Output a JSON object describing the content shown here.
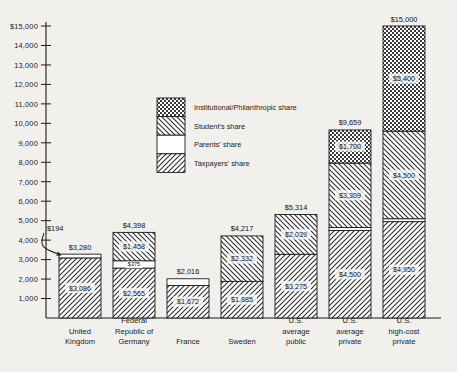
{
  "chart_data": {
    "type": "bar",
    "subtype": "stacked-bar",
    "title": "",
    "xlabel": "",
    "ylabel": "",
    "ylim": [
      0,
      15000
    ],
    "ytick_values": [
      1000,
      2000,
      3000,
      4000,
      5000,
      6000,
      7000,
      8000,
      9000,
      10000,
      11000,
      12000,
      13000,
      14000,
      15000
    ],
    "ytick_labels": [
      "1,000",
      "2,000",
      "3,000",
      "4,000",
      "5,000",
      "6,000",
      "7,000",
      "8,000",
      "9,000",
      "10,000",
      "11,000",
      "12,000",
      "13,000",
      "14,000",
      "$15,000"
    ],
    "grid": false,
    "legend_position": "upper-center",
    "categories": [
      "United Kingdom",
      "Federal Republic of Germany",
      "France",
      "Sweden",
      "U.S. average public",
      "U.S. average private",
      "U.S. high-cost private"
    ],
    "category_label_lines": [
      [
        "United",
        "Kingdom"
      ],
      [
        "Federal",
        "Republic of",
        "Germany"
      ],
      [
        "France"
      ],
      [
        "Sweden"
      ],
      [
        "U.S.",
        "average",
        "public"
      ],
      [
        "U.S.",
        "average",
        "private"
      ],
      [
        "U.S.",
        "high-cost",
        "private"
      ]
    ],
    "series": [
      {
        "name": "Taxpayers' share",
        "pattern": "diagonal-hatch-up",
        "values": [
          3086,
          2565,
          1672,
          1885,
          3275,
          4500,
          4950
        ],
        "labels": [
          "$3,086",
          "$2,565",
          "$1,672",
          "$1,885",
          "$3,275",
          "$4,500",
          "$4,950"
        ]
      },
      {
        "name": "Parents' share",
        "pattern": "solid-white",
        "values": [
          194,
          375,
          344,
          0,
          0,
          150,
          150
        ],
        "labels": [
          "$194",
          "$375",
          "$344",
          "",
          "",
          "$150",
          "$150"
        ]
      },
      {
        "name": "Student's share",
        "pattern": "diagonal-hatch-down",
        "values": [
          0,
          1458,
          0,
          2332,
          2039,
          3309,
          4500
        ],
        "labels": [
          "",
          "$1,458",
          "",
          "$2,332",
          "$2,039",
          "$3,309",
          "$4,500"
        ]
      },
      {
        "name": "Institutional/Philanthropic share",
        "pattern": "checkerboard",
        "values": [
          0,
          0,
          0,
          0,
          0,
          1700,
          5400
        ],
        "labels": [
          "",
          "",
          "",
          "",
          "",
          "$1,700",
          "$5,400"
        ]
      }
    ],
    "totals": [
      3280,
      4398,
      2016,
      4217,
      5314,
      9659,
      15000
    ],
    "total_labels": [
      "$3,280",
      "$4,398",
      "$2,016",
      "$4,217",
      "$5,314",
      "$9,659",
      "$15,000"
    ],
    "annotations": [
      {
        "text": "$194",
        "target_category": "United Kingdom",
        "target_series": "Parents' share",
        "style": "curved-arrow"
      }
    ]
  },
  "legend": {
    "items": [
      {
        "label": "Institutional/Philanthropic share",
        "pattern": "checkerboard"
      },
      {
        "label": "Student's share",
        "pattern": "diagonal-hatch-down"
      },
      {
        "label": "Parents' share",
        "pattern": "solid-white"
      },
      {
        "label": "Taxpayers' share",
        "pattern": "diagonal-hatch-up"
      }
    ]
  },
  "colors": {
    "background": "#f2f0ec",
    "ink": "#1a1a1a",
    "fill_white": "#ffffff",
    "hatch": "#2a2a2a"
  }
}
